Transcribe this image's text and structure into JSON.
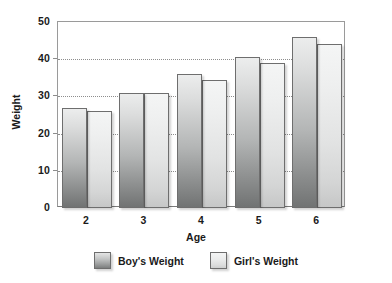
{
  "chart_data": {
    "type": "bar",
    "title": "",
    "xlabel": "Age",
    "ylabel": "Weight",
    "categories": [
      "2",
      "3",
      "4",
      "5",
      "6"
    ],
    "series": [
      {
        "name": "Boy's  Weight",
        "values": [
          27,
          31,
          36,
          40.5,
          46
        ]
      },
      {
        "name": "Girl's Weight",
        "values": [
          26,
          31,
          34.5,
          39,
          44
        ]
      }
    ],
    "ylim": [
      0,
      50
    ],
    "yticks": [
      0,
      10,
      20,
      30,
      40,
      50
    ],
    "ytick_labels": [
      "0",
      "10",
      "20",
      "30",
      "40",
      "50"
    ],
    "grid": true,
    "grid_axis": "y",
    "legend_position": "bottom",
    "colors": {
      "boys": "#9b9d9d",
      "girls": "#e2e3e3",
      "bar_border": "#6e6e6e",
      "gridline": "#8d8d8d",
      "axis": "#9a9a9a",
      "text": "#1a1a1a",
      "background": "#ffffff"
    }
  },
  "legend": {
    "items": [
      {
        "label": "Boy's  Weight",
        "swatch": "boys"
      },
      {
        "label": "Girl's Weight",
        "swatch": "girls"
      }
    ]
  }
}
